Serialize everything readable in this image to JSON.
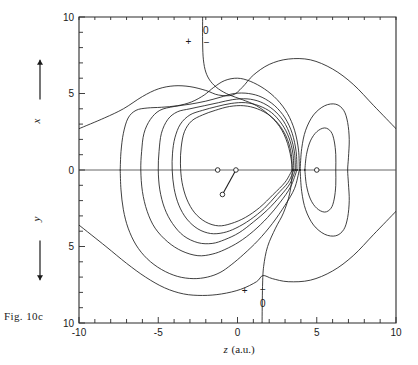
{
  "figure": {
    "caption": "Fig. 10c",
    "xaxis": {
      "label_symbol": "z",
      "label_units": "(a.u.)",
      "ticks": [
        -10,
        -5,
        0,
        5,
        10
      ],
      "tick_labels": [
        "-10",
        "-5",
        "0",
        "5",
        "10"
      ],
      "range": [
        -10,
        10
      ],
      "minor_tick_step": 1
    },
    "yaxis": {
      "upper_symbol": "x",
      "lower_symbol": "y",
      "ticks": [
        10,
        5,
        0,
        5,
        10
      ],
      "tick_labels": [
        "10",
        "5",
        "0",
        "5",
        "10"
      ],
      "range": [
        -10,
        10
      ],
      "minor_tick_step": 1
    },
    "annotations": [
      {
        "name": "top-nodal-zero",
        "text": "0",
        "z": -2.0,
        "v": 8.9
      },
      {
        "name": "top-plus",
        "text": "+",
        "z": -3.1,
        "v": 8.2
      },
      {
        "name": "top-minus",
        "text": "−",
        "z": -1.95,
        "v": 8.1
      },
      {
        "name": "bottom-plus",
        "text": "+",
        "z": 0.45,
        "v": -8.1
      },
      {
        "name": "bottom-minus",
        "text": "−",
        "z": 1.6,
        "v": -8.05
      },
      {
        "name": "bottom-nodal-zero",
        "text": "0",
        "z": 1.6,
        "v": -8.95
      }
    ],
    "atoms": [
      {
        "name": "atom-left-axis",
        "z": -1.25,
        "v": 0.0
      },
      {
        "name": "atom-center",
        "z": -0.1,
        "v": 0.0
      },
      {
        "name": "atom-lower-bonded",
        "z": -0.95,
        "v": -1.6
      },
      {
        "name": "atom-right-axis",
        "z": 5.0,
        "v": 0.0
      }
    ],
    "bonds": [
      {
        "name": "bond-center-lower",
        "from": 1,
        "to": 2
      }
    ],
    "colors": {
      "contour": "#1e1e1e",
      "frame": "#2b2b2b",
      "axis": "#555555",
      "background": "#ffffff"
    }
  },
  "chart_data": {
    "type": "line",
    "title": "",
    "subtitle": "",
    "xlabel": "z (a.u.)",
    "ylabel": "x  /  y (a.u.)",
    "xlim": [
      -10,
      10
    ],
    "ylim": [
      -10,
      10
    ],
    "grid": false,
    "legend": "none",
    "series": [
      {
        "name": "nodal-contour-0",
        "level": 0,
        "closed": false,
        "points_zv": [
          [
            -2.2,
            10.0
          ],
          [
            -2.2,
            8.3
          ],
          [
            -2.15,
            7.2
          ],
          [
            -2.0,
            6.4
          ],
          [
            -1.7,
            5.8
          ],
          [
            -1.2,
            5.3
          ],
          [
            -0.5,
            4.9
          ],
          [
            0.3,
            4.6
          ],
          [
            1.2,
            4.2
          ],
          [
            2.1,
            3.5
          ],
          [
            2.8,
            2.6
          ],
          [
            3.25,
            1.4
          ],
          [
            3.45,
            0.0
          ],
          [
            3.3,
            -1.5
          ],
          [
            2.9,
            -2.8
          ],
          [
            2.4,
            -3.8
          ],
          [
            1.9,
            -5.0
          ],
          [
            1.65,
            -6.3
          ],
          [
            1.58,
            -7.6
          ],
          [
            1.55,
            -10.0
          ]
        ]
      },
      {
        "name": "outer-contour-1",
        "level": 1,
        "closed": false,
        "points_zv": [
          [
            10.0,
            2.7
          ],
          [
            8.6,
            4.2
          ],
          [
            7.3,
            5.6
          ],
          [
            6.0,
            6.6
          ],
          [
            4.6,
            7.2
          ],
          [
            3.2,
            7.25
          ],
          [
            2.0,
            6.9
          ],
          [
            1.0,
            6.2
          ],
          [
            0.3,
            5.4
          ],
          [
            -0.3,
            4.9
          ],
          [
            -1.2,
            4.9
          ],
          [
            -2.0,
            5.2
          ],
          [
            -3.0,
            5.45
          ],
          [
            -4.0,
            5.5
          ],
          [
            -5.0,
            5.3
          ],
          [
            -6.0,
            4.8
          ],
          [
            -7.2,
            4.0
          ],
          [
            -8.4,
            3.4
          ],
          [
            -10.0,
            2.7
          ]
        ]
      },
      {
        "name": "outer-contour-1-lower",
        "level": 1,
        "closed": false,
        "points_zv": [
          [
            10.0,
            -2.7
          ],
          [
            8.6,
            -4.2
          ],
          [
            7.3,
            -5.6
          ],
          [
            6.0,
            -6.6
          ],
          [
            4.6,
            -7.2
          ],
          [
            3.2,
            -7.3
          ],
          [
            2.2,
            -7.1
          ],
          [
            1.6,
            -6.9
          ],
          [
            1.2,
            -7.3
          ],
          [
            0.2,
            -7.8
          ],
          [
            -1.0,
            -8.1
          ],
          [
            -2.2,
            -8.2
          ],
          [
            -3.4,
            -8.1
          ],
          [
            -4.6,
            -7.7
          ],
          [
            -5.8,
            -7.0
          ],
          [
            -7.0,
            -6.1
          ],
          [
            -8.3,
            -5.0
          ],
          [
            -10.0,
            -3.6
          ]
        ]
      },
      {
        "name": "mid-contour-2-upper",
        "level": 2,
        "closed": false,
        "points_zv": [
          [
            3.9,
            0.0
          ],
          [
            3.85,
            1.3
          ],
          [
            3.6,
            2.6
          ],
          [
            3.15,
            3.7
          ],
          [
            2.5,
            4.6
          ],
          [
            1.7,
            5.3
          ],
          [
            0.8,
            5.8
          ],
          [
            0.0,
            6.0
          ],
          [
            -0.8,
            5.85
          ],
          [
            -1.5,
            5.4
          ],
          [
            -2.1,
            4.9
          ],
          [
            -2.9,
            4.45
          ],
          [
            -3.8,
            4.2
          ],
          [
            -4.8,
            4.1
          ],
          [
            -5.7,
            4.05
          ],
          [
            -6.4,
            3.9
          ],
          [
            -6.9,
            3.4
          ],
          [
            -7.2,
            2.4
          ],
          [
            -7.35,
            1.2
          ],
          [
            -7.4,
            0.0
          ]
        ]
      },
      {
        "name": "mid-contour-2-lower",
        "level": 2,
        "closed": false,
        "points_zv": [
          [
            -7.4,
            0.0
          ],
          [
            -7.35,
            -1.3
          ],
          [
            -7.2,
            -2.6
          ],
          [
            -6.9,
            -3.8
          ],
          [
            -6.4,
            -4.9
          ],
          [
            -5.7,
            -5.8
          ],
          [
            -4.8,
            -6.5
          ],
          [
            -3.8,
            -6.95
          ],
          [
            -2.8,
            -7.1
          ],
          [
            -1.9,
            -7.0
          ],
          [
            -1.1,
            -6.7
          ],
          [
            -0.4,
            -6.2
          ],
          [
            0.4,
            -5.5
          ],
          [
            1.3,
            -4.6
          ],
          [
            2.2,
            -3.5
          ],
          [
            3.0,
            -2.3
          ],
          [
            3.6,
            -1.2
          ],
          [
            3.9,
            0.0
          ]
        ]
      },
      {
        "name": "inner-contour-3",
        "level": 3,
        "closed": true,
        "points_zv": [
          [
            3.75,
            0.0
          ],
          [
            3.7,
            1.2
          ],
          [
            3.45,
            2.4
          ],
          [
            3.0,
            3.4
          ],
          [
            2.35,
            4.2
          ],
          [
            1.55,
            4.75
          ],
          [
            0.7,
            5.0
          ],
          [
            -0.2,
            5.0
          ],
          [
            -1.1,
            4.75
          ],
          [
            -2.0,
            4.5
          ],
          [
            -3.0,
            4.3
          ],
          [
            -4.0,
            4.15
          ],
          [
            -4.9,
            3.9
          ],
          [
            -5.5,
            3.3
          ],
          [
            -5.9,
            2.4
          ],
          [
            -6.05,
            1.2
          ],
          [
            -6.1,
            0.0
          ],
          [
            -6.0,
            -1.4
          ],
          [
            -5.7,
            -2.7
          ],
          [
            -5.2,
            -3.8
          ],
          [
            -4.4,
            -4.7
          ],
          [
            -3.5,
            -5.3
          ],
          [
            -2.5,
            -5.6
          ],
          [
            -1.6,
            -5.5
          ],
          [
            -0.8,
            -5.2
          ],
          [
            0.1,
            -4.7
          ],
          [
            1.0,
            -4.0
          ],
          [
            1.9,
            -3.1
          ],
          [
            2.7,
            -2.1
          ],
          [
            3.35,
            -1.1
          ],
          [
            3.75,
            0.0
          ]
        ]
      },
      {
        "name": "inner-contour-4",
        "level": 4,
        "closed": true,
        "points_zv": [
          [
            3.65,
            0.0
          ],
          [
            3.6,
            1.1
          ],
          [
            3.35,
            2.2
          ],
          [
            2.9,
            3.2
          ],
          [
            2.25,
            3.95
          ],
          [
            1.45,
            4.45
          ],
          [
            0.6,
            4.65
          ],
          [
            -0.3,
            4.6
          ],
          [
            -1.2,
            4.4
          ],
          [
            -2.1,
            4.2
          ],
          [
            -3.0,
            4.0
          ],
          [
            -3.8,
            3.8
          ],
          [
            -4.4,
            3.3
          ],
          [
            -4.8,
            2.4
          ],
          [
            -4.95,
            1.2
          ],
          [
            -5.0,
            0.0
          ],
          [
            -4.9,
            -1.3
          ],
          [
            -4.6,
            -2.5
          ],
          [
            -4.1,
            -3.5
          ],
          [
            -3.4,
            -4.3
          ],
          [
            -2.5,
            -4.75
          ],
          [
            -1.6,
            -4.8
          ],
          [
            -0.8,
            -4.55
          ],
          [
            0.1,
            -4.1
          ],
          [
            1.0,
            -3.4
          ],
          [
            1.9,
            -2.6
          ],
          [
            2.7,
            -1.7
          ],
          [
            3.3,
            -0.9
          ],
          [
            3.65,
            0.0
          ]
        ]
      },
      {
        "name": "inner-contour-5",
        "level": 5,
        "closed": true,
        "points_zv": [
          [
            3.55,
            0.0
          ],
          [
            3.5,
            1.05
          ],
          [
            3.25,
            2.1
          ],
          [
            2.8,
            3.0
          ],
          [
            2.15,
            3.75
          ],
          [
            1.35,
            4.2
          ],
          [
            0.5,
            4.4
          ],
          [
            -0.4,
            4.35
          ],
          [
            -1.3,
            4.15
          ],
          [
            -2.2,
            3.9
          ],
          [
            -3.0,
            3.6
          ],
          [
            -3.6,
            3.0
          ],
          [
            -3.95,
            2.1
          ],
          [
            -4.1,
            1.1
          ],
          [
            -4.12,
            0.0
          ],
          [
            -4.0,
            -1.2
          ],
          [
            -3.7,
            -2.3
          ],
          [
            -3.2,
            -3.2
          ],
          [
            -2.5,
            -3.85
          ],
          [
            -1.7,
            -4.15
          ],
          [
            -0.9,
            -4.1
          ],
          [
            -0.1,
            -3.8
          ],
          [
            0.8,
            -3.25
          ],
          [
            1.7,
            -2.5
          ],
          [
            2.5,
            -1.6
          ],
          [
            3.2,
            -0.8
          ],
          [
            3.55,
            0.0
          ]
        ]
      },
      {
        "name": "inner-contour-6",
        "level": 6,
        "closed": true,
        "points_zv": [
          [
            3.45,
            0.0
          ],
          [
            3.4,
            1.0
          ],
          [
            3.15,
            2.0
          ],
          [
            2.7,
            2.85
          ],
          [
            2.05,
            3.55
          ],
          [
            1.25,
            4.0
          ],
          [
            0.4,
            4.2
          ],
          [
            -0.5,
            4.15
          ],
          [
            -1.4,
            3.9
          ],
          [
            -2.2,
            3.6
          ],
          [
            -2.9,
            3.2
          ],
          [
            -3.35,
            2.5
          ],
          [
            -3.55,
            1.5
          ],
          [
            -3.6,
            0.4
          ],
          [
            -3.5,
            -0.8
          ],
          [
            -3.2,
            -1.9
          ],
          [
            -2.7,
            -2.8
          ],
          [
            -2.0,
            -3.4
          ],
          [
            -1.2,
            -3.65
          ],
          [
            -0.4,
            -3.5
          ],
          [
            0.5,
            -3.1
          ],
          [
            1.4,
            -2.45
          ],
          [
            2.25,
            -1.6
          ],
          [
            3.0,
            -0.8
          ],
          [
            3.45,
            0.0
          ]
        ]
      },
      {
        "name": "right-lobe-outer",
        "level": 2,
        "closed": true,
        "points_zv": [
          [
            3.95,
            0.0
          ],
          [
            4.05,
            1.4
          ],
          [
            4.3,
            2.6
          ],
          [
            4.8,
            3.6
          ],
          [
            5.5,
            4.2
          ],
          [
            6.2,
            4.3
          ],
          [
            6.7,
            3.9
          ],
          [
            6.95,
            3.1
          ],
          [
            7.05,
            2.0
          ],
          [
            7.0,
            0.8
          ],
          [
            6.95,
            0.0
          ],
          [
            7.0,
            -0.9
          ],
          [
            7.05,
            -2.0
          ],
          [
            6.95,
            -3.1
          ],
          [
            6.7,
            -3.9
          ],
          [
            6.2,
            -4.3
          ],
          [
            5.5,
            -4.2
          ],
          [
            4.8,
            -3.6
          ],
          [
            4.3,
            -2.6
          ],
          [
            4.05,
            -1.4
          ],
          [
            3.95,
            0.0
          ]
        ]
      },
      {
        "name": "right-lobe-inner",
        "level": 4,
        "closed": true,
        "points_zv": [
          [
            4.25,
            0.0
          ],
          [
            4.35,
            1.0
          ],
          [
            4.6,
            1.9
          ],
          [
            5.0,
            2.5
          ],
          [
            5.5,
            2.75
          ],
          [
            5.9,
            2.5
          ],
          [
            6.1,
            1.9
          ],
          [
            6.2,
            1.0
          ],
          [
            6.2,
            0.0
          ],
          [
            6.2,
            -1.0
          ],
          [
            6.1,
            -1.9
          ],
          [
            5.9,
            -2.5
          ],
          [
            5.5,
            -2.75
          ],
          [
            5.0,
            -2.5
          ],
          [
            4.6,
            -1.9
          ],
          [
            4.35,
            -1.0
          ],
          [
            4.25,
            0.0
          ]
        ]
      }
    ]
  }
}
